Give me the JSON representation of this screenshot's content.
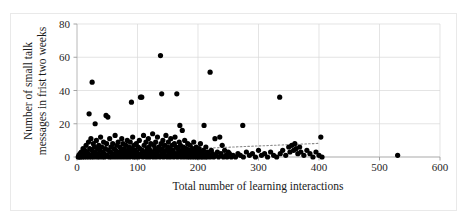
{
  "figure": {
    "border_color": "#e9e9e9",
    "background": "#ffffff"
  },
  "chart_data": {
    "type": "scatter",
    "title": "",
    "xlabel": "Total number of learning interactions",
    "ylabel_line1": "Number of small talk",
    "ylabel_line2": "messages in frist two weeks",
    "xlim": [
      0,
      600
    ],
    "ylim": [
      0,
      80
    ],
    "xticks": [
      0,
      100,
      200,
      300,
      400,
      500,
      600
    ],
    "yticks": [
      0,
      20,
      40,
      60,
      80
    ],
    "grid": true,
    "grid_color": "#d9d9d9",
    "legend": "none",
    "marker_color": "#000000",
    "marker_size": 2.6,
    "trendline": {
      "style": "dotted",
      "color": "#8c8c8c",
      "x_start": 0,
      "y_start": 2.0,
      "x_end": 400,
      "y_end": 8.2
    },
    "points": [
      [
        2,
        0
      ],
      [
        3,
        1
      ],
      [
        4,
        0
      ],
      [
        5,
        2
      ],
      [
        6,
        0
      ],
      [
        7,
        3
      ],
      [
        8,
        1
      ],
      [
        9,
        0
      ],
      [
        10,
        5
      ],
      [
        11,
        2
      ],
      [
        12,
        0
      ],
      [
        13,
        4
      ],
      [
        14,
        1
      ],
      [
        15,
        7
      ],
      [
        16,
        0
      ],
      [
        17,
        3
      ],
      [
        18,
        2
      ],
      [
        19,
        9
      ],
      [
        20,
        0
      ],
      [
        20,
        26
      ],
      [
        21,
        5
      ],
      [
        22,
        1
      ],
      [
        23,
        11
      ],
      [
        24,
        0
      ],
      [
        25,
        45
      ],
      [
        25,
        4
      ],
      [
        26,
        2
      ],
      [
        27,
        8
      ],
      [
        28,
        0
      ],
      [
        29,
        6
      ],
      [
        30,
        20
      ],
      [
        30,
        3
      ],
      [
        31,
        1
      ],
      [
        32,
        10
      ],
      [
        33,
        0
      ],
      [
        34,
        5
      ],
      [
        35,
        2
      ],
      [
        36,
        7
      ],
      [
        37,
        0
      ],
      [
        38,
        4
      ],
      [
        39,
        12
      ],
      [
        40,
        1
      ],
      [
        41,
        6
      ],
      [
        42,
        0
      ],
      [
        43,
        3
      ],
      [
        44,
        9
      ],
      [
        45,
        2
      ],
      [
        46,
        0
      ],
      [
        47,
        5
      ],
      [
        48,
        25
      ],
      [
        49,
        8
      ],
      [
        50,
        1
      ],
      [
        51,
        24
      ],
      [
        52,
        4
      ],
      [
        53,
        0
      ],
      [
        54,
        11
      ],
      [
        55,
        3
      ],
      [
        56,
        6
      ],
      [
        57,
        0
      ],
      [
        58,
        2
      ],
      [
        59,
        8
      ],
      [
        60,
        1
      ],
      [
        61,
        5
      ],
      [
        62,
        0
      ],
      [
        63,
        13
      ],
      [
        64,
        4
      ],
      [
        65,
        2
      ],
      [
        66,
        7
      ],
      [
        67,
        0
      ],
      [
        68,
        9
      ],
      [
        69,
        3
      ],
      [
        70,
        1
      ],
      [
        71,
        6
      ],
      [
        72,
        0
      ],
      [
        73,
        4
      ],
      [
        74,
        11
      ],
      [
        75,
        2
      ],
      [
        76,
        8
      ],
      [
        77,
        0
      ],
      [
        78,
        5
      ],
      [
        79,
        3
      ],
      [
        80,
        1
      ],
      [
        81,
        7
      ],
      [
        82,
        0
      ],
      [
        83,
        10
      ],
      [
        84,
        4
      ],
      [
        85,
        2
      ],
      [
        86,
        6
      ],
      [
        87,
        0
      ],
      [
        88,
        9
      ],
      [
        89,
        3
      ],
      [
        90,
        33
      ],
      [
        90,
        1
      ],
      [
        91,
        5
      ],
      [
        92,
        12
      ],
      [
        93,
        0
      ],
      [
        94,
        7
      ],
      [
        95,
        2
      ],
      [
        96,
        4
      ],
      [
        97,
        0
      ],
      [
        98,
        8
      ],
      [
        99,
        3
      ],
      [
        100,
        1
      ],
      [
        101,
        6
      ],
      [
        102,
        0
      ],
      [
        103,
        10
      ],
      [
        104,
        5
      ],
      [
        105,
        36
      ],
      [
        106,
        2
      ],
      [
        107,
        36
      ],
      [
        108,
        4
      ],
      [
        109,
        0
      ],
      [
        110,
        13
      ],
      [
        111,
        7
      ],
      [
        112,
        1
      ],
      [
        113,
        3
      ],
      [
        114,
        9
      ],
      [
        115,
        0
      ],
      [
        116,
        5
      ],
      [
        117,
        2
      ],
      [
        118,
        11
      ],
      [
        119,
        6
      ],
      [
        120,
        0
      ],
      [
        121,
        4
      ],
      [
        122,
        8
      ],
      [
        123,
        1
      ],
      [
        124,
        3
      ],
      [
        125,
        14
      ],
      [
        126,
        0
      ],
      [
        127,
        7
      ],
      [
        128,
        2
      ],
      [
        129,
        5
      ],
      [
        130,
        9
      ],
      [
        131,
        0
      ],
      [
        132,
        3
      ],
      [
        133,
        12
      ],
      [
        134,
        1
      ],
      [
        135,
        6
      ],
      [
        136,
        4
      ],
      [
        137,
        0
      ],
      [
        138,
        61
      ],
      [
        139,
        8
      ],
      [
        140,
        38
      ],
      [
        140,
        2
      ],
      [
        141,
        5
      ],
      [
        142,
        10
      ],
      [
        143,
        0
      ],
      [
        144,
        3
      ],
      [
        145,
        7
      ],
      [
        146,
        1
      ],
      [
        147,
        13
      ],
      [
        148,
        4
      ],
      [
        149,
        0
      ],
      [
        150,
        6
      ],
      [
        151,
        9
      ],
      [
        152,
        2
      ],
      [
        153,
        5
      ],
      [
        154,
        0
      ],
      [
        155,
        11
      ],
      [
        156,
        3
      ],
      [
        157,
        7
      ],
      [
        158,
        1
      ],
      [
        159,
        4
      ],
      [
        160,
        0
      ],
      [
        161,
        8
      ],
      [
        162,
        12
      ],
      [
        163,
        2
      ],
      [
        164,
        6
      ],
      [
        165,
        38
      ],
      [
        166,
        0
      ],
      [
        167,
        5
      ],
      [
        168,
        3
      ],
      [
        169,
        9
      ],
      [
        170,
        19
      ],
      [
        170,
        1
      ],
      [
        171,
        7
      ],
      [
        172,
        0
      ],
      [
        173,
        4
      ],
      [
        174,
        16
      ],
      [
        175,
        2
      ],
      [
        176,
        6
      ],
      [
        177,
        0
      ],
      [
        178,
        10
      ],
      [
        179,
        3
      ],
      [
        180,
        1
      ],
      [
        181,
        5
      ],
      [
        182,
        0
      ],
      [
        183,
        8
      ],
      [
        184,
        2
      ],
      [
        185,
        4
      ],
      [
        186,
        0
      ],
      [
        187,
        7
      ],
      [
        188,
        1
      ],
      [
        189,
        3
      ],
      [
        190,
        0
      ],
      [
        191,
        5
      ],
      [
        192,
        2
      ],
      [
        193,
        9
      ],
      [
        194,
        0
      ],
      [
        195,
        4
      ],
      [
        196,
        1
      ],
      [
        197,
        6
      ],
      [
        198,
        0
      ],
      [
        199,
        3
      ],
      [
        200,
        2
      ],
      [
        201,
        0
      ],
      [
        202,
        5
      ],
      [
        203,
        1
      ],
      [
        204,
        8
      ],
      [
        205,
        0
      ],
      [
        206,
        3
      ],
      [
        207,
        2
      ],
      [
        208,
        0
      ],
      [
        209,
        4
      ],
      [
        210,
        19
      ],
      [
        211,
        1
      ],
      [
        212,
        0
      ],
      [
        213,
        6
      ],
      [
        214,
        2
      ],
      [
        215,
        0
      ],
      [
        216,
        3
      ],
      [
        218,
        1
      ],
      [
        220,
        51
      ],
      [
        220,
        0
      ],
      [
        222,
        4
      ],
      [
        224,
        2
      ],
      [
        226,
        0
      ],
      [
        228,
        11
      ],
      [
        230,
        1
      ],
      [
        232,
        3
      ],
      [
        234,
        0
      ],
      [
        236,
        12
      ],
      [
        238,
        2
      ],
      [
        240,
        7
      ],
      [
        242,
        0
      ],
      [
        244,
        4
      ],
      [
        246,
        1
      ],
      [
        248,
        0
      ],
      [
        250,
        3
      ],
      [
        252,
        2
      ],
      [
        255,
        0
      ],
      [
        258,
        1
      ],
      [
        262,
        0
      ],
      [
        266,
        2
      ],
      [
        270,
        1
      ],
      [
        274,
        19
      ],
      [
        275,
        0
      ],
      [
        280,
        3
      ],
      [
        285,
        1
      ],
      [
        290,
        2
      ],
      [
        295,
        0
      ],
      [
        300,
        4
      ],
      [
        305,
        1
      ],
      [
        310,
        2
      ],
      [
        315,
        0
      ],
      [
        320,
        3
      ],
      [
        325,
        1
      ],
      [
        330,
        0
      ],
      [
        335,
        36
      ],
      [
        336,
        2
      ],
      [
        340,
        4
      ],
      [
        345,
        1
      ],
      [
        350,
        6
      ],
      [
        352,
        3
      ],
      [
        355,
        7
      ],
      [
        358,
        4
      ],
      [
        360,
        8
      ],
      [
        362,
        5
      ],
      [
        365,
        2
      ],
      [
        368,
        6
      ],
      [
        370,
        3
      ],
      [
        375,
        1
      ],
      [
        380,
        4
      ],
      [
        385,
        2
      ],
      [
        390,
        0
      ],
      [
        395,
        3
      ],
      [
        400,
        1
      ],
      [
        403,
        12
      ],
      [
        405,
        0
      ],
      [
        530,
        1
      ]
    ]
  }
}
